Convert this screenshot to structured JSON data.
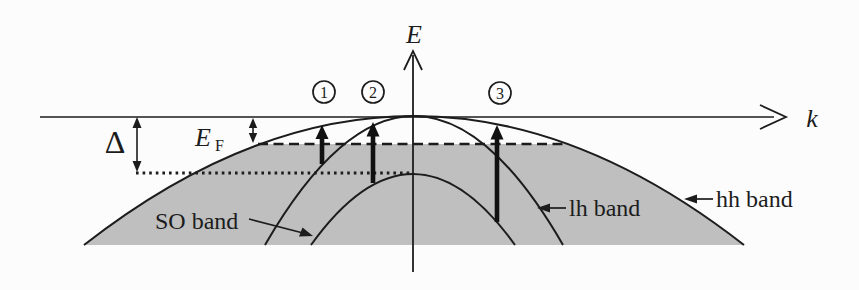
{
  "figure": {
    "type": "band-structure-diagram",
    "axes": {
      "vertical_label": "E",
      "horizontal_label": "k"
    },
    "measures": {
      "spin_orbit_split_label": "Δ",
      "fermi_level_label": "E",
      "fermi_level_subscript": "F"
    },
    "transitions": [
      {
        "label": "1",
        "from_band": "lh band",
        "to_band": "hh band"
      },
      {
        "label": "2",
        "from_band": "SO band",
        "to_band": "lh band"
      },
      {
        "label": "3",
        "from_band": "SO band",
        "to_band": "hh band"
      }
    ],
    "bands": [
      {
        "label": "SO band"
      },
      {
        "label": "lh band"
      },
      {
        "label": "hh band"
      }
    ],
    "lines": {
      "dashed_line_meaning": "Fermi level",
      "dotted_line_meaning": "top of SO band"
    },
    "colors": {
      "background": "#fcfcfc",
      "shade": "#bfbfbf",
      "line": "#1c1c1c"
    }
  }
}
